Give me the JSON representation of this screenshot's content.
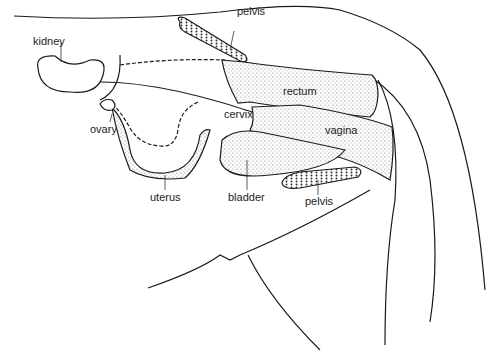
{
  "diagram": {
    "labels": [
      {
        "id": "kidney",
        "text": "kidney",
        "x": 49,
        "y": 35
      },
      {
        "id": "pelvis-top",
        "text": "pelvis",
        "x": 225,
        "y": 23
      },
      {
        "id": "rectum",
        "text": "rectum",
        "x": 283,
        "y": 86
      },
      {
        "id": "cervix",
        "text": "cervix",
        "x": 225,
        "y": 113
      },
      {
        "id": "vagina",
        "text": "vagina",
        "x": 325,
        "y": 126
      },
      {
        "id": "ovary",
        "text": "ovary",
        "x": 90,
        "y": 126
      },
      {
        "id": "uterus",
        "text": "uterus",
        "x": 150,
        "y": 194
      },
      {
        "id": "bladder",
        "text": "bladder",
        "x": 229,
        "y": 193
      },
      {
        "id": "pelvis-bottom",
        "text": "pelvis",
        "x": 306,
        "y": 198
      }
    ],
    "colors": {
      "line": "#1a1a1a",
      "stipple": "#d9d9d9",
      "background": "#ffffff"
    }
  }
}
